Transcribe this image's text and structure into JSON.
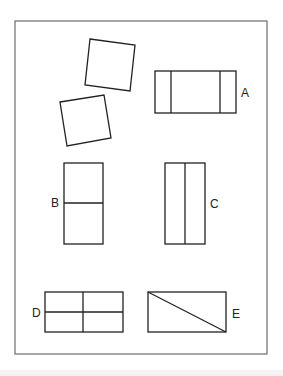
{
  "figure": {
    "frame": {
      "x": 15,
      "y": 21,
      "w": 252,
      "h": 333,
      "color": "#6b6b6b"
    },
    "stroke_color": "#222222",
    "pieces": [
      {
        "name": "square-1",
        "points": "90,39 135,45 130,91 85,85"
      },
      {
        "name": "square-2",
        "points": "60,102 104,95 111,138 67,146"
      }
    ],
    "options": [
      {
        "label": "A",
        "rect": {
          "x": 155,
          "y": 71,
          "w": 81,
          "h": 42
        },
        "lines": [
          [
            171,
            71,
            171,
            113
          ],
          [
            220,
            71,
            220,
            113
          ]
        ],
        "label_pos": {
          "x": 241,
          "y": 97
        }
      },
      {
        "label": "B",
        "rect": {
          "x": 64,
          "y": 163,
          "w": 39,
          "h": 81
        },
        "lines": [
          [
            64,
            203,
            103,
            203
          ]
        ],
        "label_pos": {
          "x": 51,
          "y": 207
        }
      },
      {
        "label": "C",
        "rect": {
          "x": 165,
          "y": 163,
          "w": 40,
          "h": 81
        },
        "lines": [
          [
            185,
            163,
            185,
            244
          ]
        ],
        "label_pos": {
          "x": 210,
          "y": 208
        }
      },
      {
        "label": "D",
        "rect": {
          "x": 45,
          "y": 292,
          "w": 78,
          "h": 40
        },
        "lines": [
          [
            83,
            292,
            83,
            332
          ],
          [
            45,
            312,
            123,
            312
          ]
        ],
        "label_pos": {
          "x": 32,
          "y": 317
        }
      },
      {
        "label": "E",
        "rect": {
          "x": 148,
          "y": 292,
          "w": 78,
          "h": 40
        },
        "lines": [
          [
            148,
            292,
            226,
            332
          ]
        ],
        "label_pos": {
          "x": 232,
          "y": 318
        }
      }
    ]
  }
}
